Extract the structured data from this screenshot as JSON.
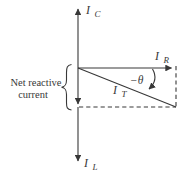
{
  "figure": {
    "background": "#ffffff",
    "ink_color": "#383838",
    "labels": {
      "ic": {
        "base": "I",
        "sub": "C"
      },
      "ir": {
        "base": "I",
        "sub": "R"
      },
      "it": {
        "base": "I",
        "sub": "T"
      },
      "il": {
        "base": "I",
        "sub": "L"
      },
      "angle": "−θ",
      "net_reactive": {
        "line1": "Net reactive",
        "line2": "current"
      }
    }
  }
}
